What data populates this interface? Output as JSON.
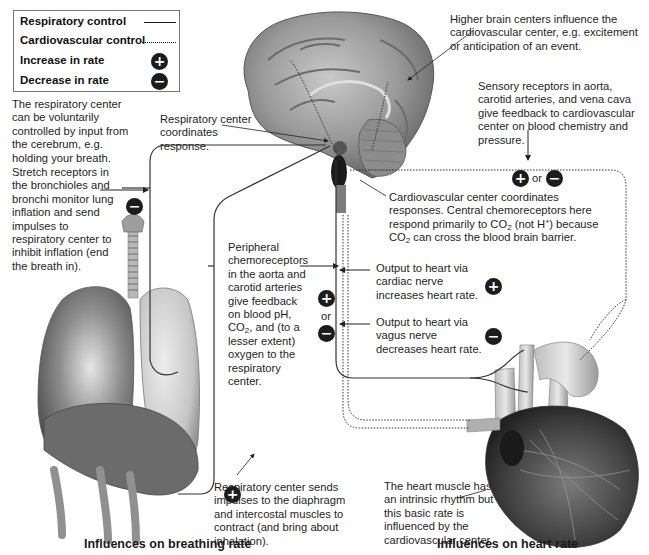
{
  "legend": {
    "respiratory_label": "Respiratory control",
    "cardiovascular_label": "Cardiovascular control",
    "increase_label": "Increase in rate",
    "decrease_label": "Decrease in rate",
    "increase_symbol": "+",
    "decrease_symbol": "−"
  },
  "annotations": {
    "voluntary_control": "The respiratory center can be voluntarily controlled by input from the cerebrum, e.g. holding your breath.",
    "stretch_receptors": "Stretch receptors in the bronchioles and bronchi monitor lung inflation and send impulses to respiratory center to inhibit inflation (end the breath in).",
    "respiratory_center": "Respiratory center coordinates response.",
    "higher_brain": "Higher brain centers influence the cardiovascular center, e.g. excitement or anticipation of an event.",
    "sensory_receptors": "Sensory receptors in aorta, carotid arteries, and vena cava give feedback to cardiovascular center on blood chemistry and pressure.",
    "cardio_center_line1": "Cardiovascular center coordinates",
    "cardio_center_line2": "responses. Central chemoreceptors here",
    "cardio_center_line3a": "respond primarily to CO",
    "cardio_center_line3b": "2",
    "cardio_center_line3c": " (not H",
    "cardio_center_line3d": "+",
    "cardio_center_line3e": ") because",
    "cardio_center_line4a": "CO",
    "cardio_center_line4b": "2",
    "cardio_center_line4c": " can cross the blood brain barrier.",
    "peripheral_a": "Peripheral chemoreceptors in the aorta and carotid arteries give feedback on blood pH, CO",
    "peripheral_sub": "2",
    "peripheral_b": ", and (to a lesser extent) oxygen to the respiratory center.",
    "or_label": "or",
    "cardiac_nerve": "Output to heart via cardiac nerve increases heart rate.",
    "vagus_nerve": "Output to heart via vagus nerve decreases heart rate.",
    "diaphragm": "Respiratory center sends impulses to the diaphragm and intercostal muscles to contract (and bring about inhalation).",
    "heart_muscle": "The heart muscle has an intrinsic rhythm but this basic rate is influenced by the cardiovascular center."
  },
  "titles": {
    "breathing": "Influences on breathing rate",
    "heart": "Influences on heart rate"
  },
  "colors": {
    "badge": "#1c1c1c",
    "line": "#333333",
    "organ_shade": "#8a8a8a"
  }
}
